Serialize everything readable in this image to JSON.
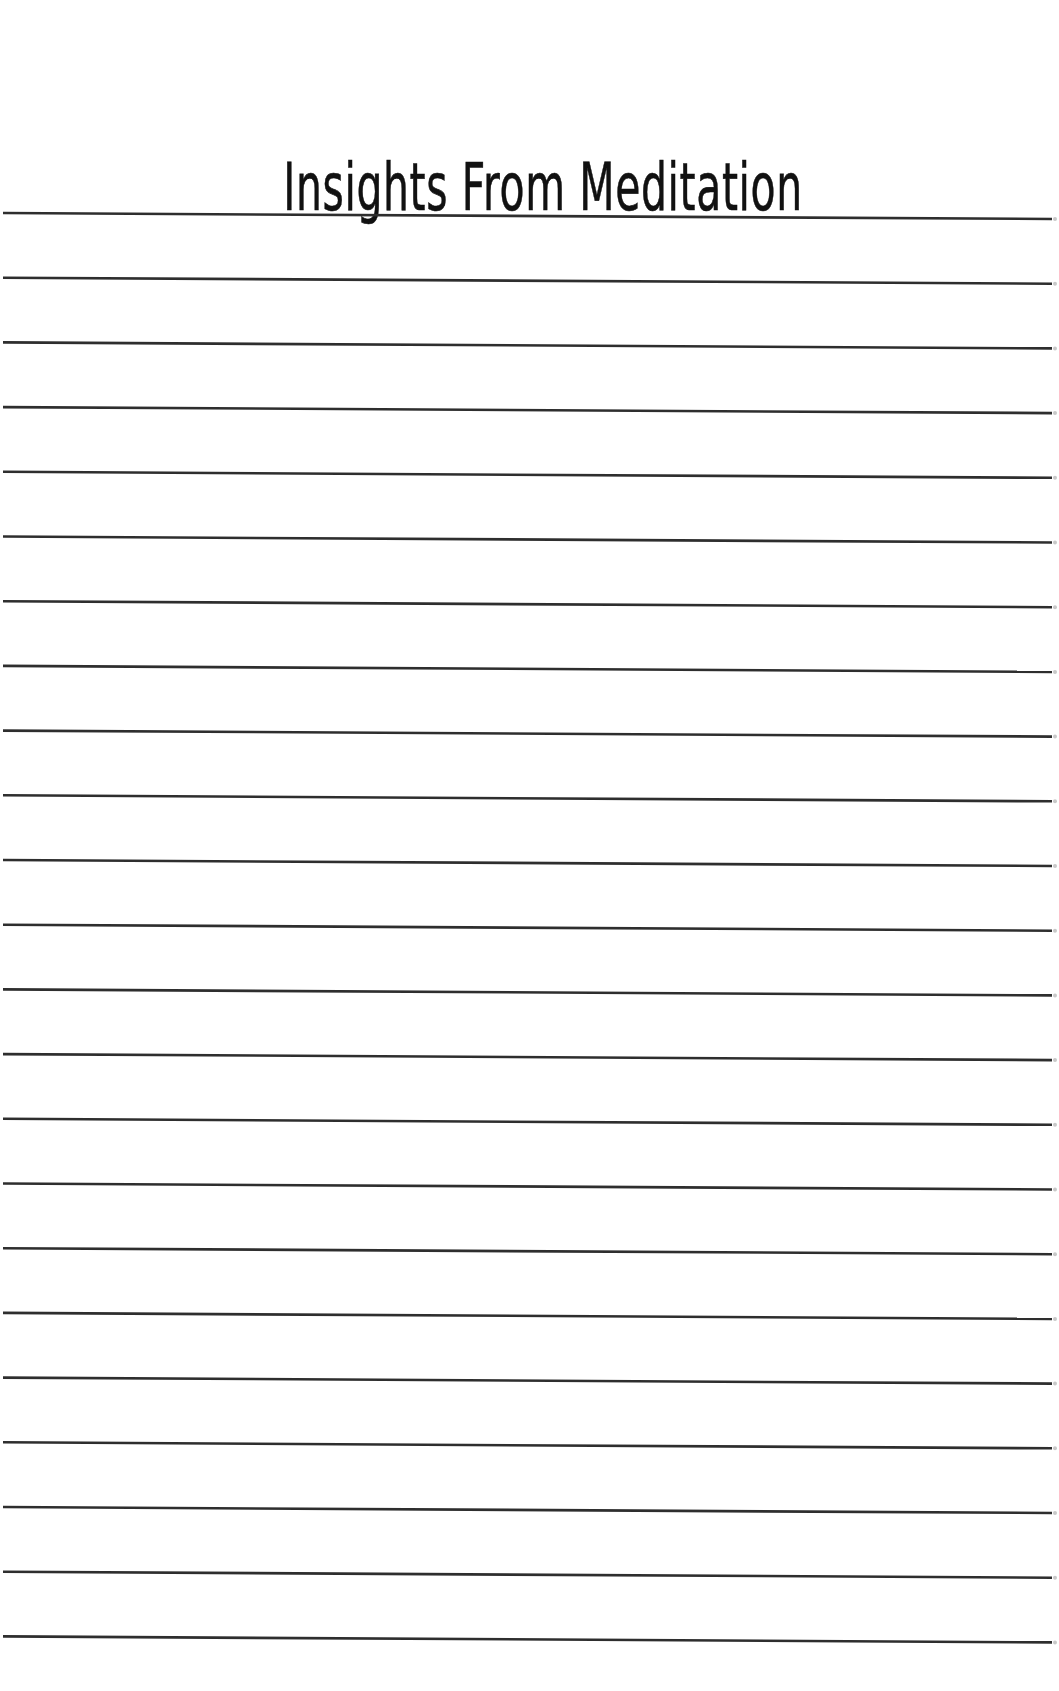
{
  "page": {
    "title": "Insights From Meditation",
    "line_count": 23,
    "line_color": "#2e2e2e",
    "line_thickness": 2.6,
    "first_line_y_left": 213,
    "line_spacing": 64.7,
    "line_slope_px": 6,
    "line_x_start": 3,
    "line_x_end": 1052,
    "edge_tick_color": "#c8c8c8",
    "background": "#ffffff",
    "title_color": "#111111"
  }
}
